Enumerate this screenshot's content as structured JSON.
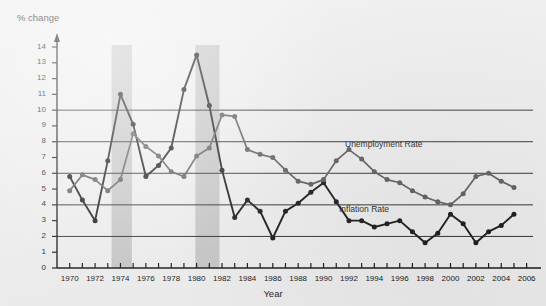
{
  "chart_data": {
    "type": "line",
    "title": "",
    "ylabel": "% change",
    "xlabel": "Year",
    "xlim": [
      1969,
      2006.5
    ],
    "ylim": [
      0,
      14.6
    ],
    "grid": "horizontal gridlines at 2, 4, 6, 8, 10",
    "legend_position": "inline annotations near series",
    "y_ticks": [
      0,
      1,
      2,
      3,
      4,
      5,
      6,
      7,
      8,
      9,
      10,
      11,
      12,
      13,
      14
    ],
    "gridline_values": [
      2,
      4,
      6,
      8,
      10
    ],
    "x_ticks": [
      1970,
      1971,
      1972,
      1973,
      1974,
      1975,
      1976,
      1977,
      1978,
      1979,
      1980,
      1981,
      1982,
      1983,
      1984,
      1985,
      1986,
      1987,
      1988,
      1989,
      1990,
      1991,
      1992,
      1993,
      1994,
      1995,
      1996,
      1997,
      1998,
      1999,
      2000,
      2001,
      2002,
      2003,
      2004,
      2005,
      2006
    ],
    "x_tick_labels": [
      "1970",
      "1972",
      "1974",
      "1976",
      "1978",
      "1980",
      "1982",
      "1984",
      "1986",
      "1988",
      "1990",
      "1992",
      "1994",
      "1996",
      "1998",
      "2000",
      "2002",
      "2004",
      "2006"
    ],
    "x_tick_label_values": [
      1970,
      1972,
      1974,
      1976,
      1978,
      1980,
      1982,
      1984,
      1986,
      1988,
      1990,
      1992,
      1994,
      1996,
      1998,
      2000,
      2002,
      2004,
      2006
    ],
    "x": [
      1970,
      1971,
      1972,
      1973,
      1974,
      1975,
      1976,
      1977,
      1978,
      1979,
      1980,
      1981,
      1982,
      1983,
      1984,
      1985,
      1986,
      1987,
      1988,
      1989,
      1990,
      1991,
      1992,
      1993,
      1994,
      1995,
      1996,
      1997,
      1998,
      1999,
      2000,
      2001,
      2002,
      2003,
      2004,
      2005
    ],
    "series": [
      {
        "name": "Inflation Rate",
        "color": "#141414",
        "values": [
          5.8,
          4.3,
          3.0,
          6.8,
          11.0,
          9.1,
          5.8,
          6.5,
          7.6,
          11.3,
          13.5,
          10.3,
          6.2,
          3.2,
          4.3,
          3.6,
          1.9,
          3.6,
          4.1,
          4.8,
          5.4,
          4.2,
          3.0,
          3.0,
          2.6,
          2.8,
          3.0,
          2.3,
          1.6,
          2.2,
          3.4,
          2.8,
          1.6,
          2.3,
          2.7,
          3.4
        ]
      },
      {
        "name": "Unemployment Rate",
        "color": "#595959",
        "values": [
          4.9,
          5.9,
          5.6,
          4.9,
          5.6,
          8.5,
          7.7,
          7.1,
          6.1,
          5.8,
          7.1,
          7.6,
          9.7,
          9.6,
          7.5,
          7.2,
          7.0,
          6.2,
          5.5,
          5.3,
          5.6,
          6.8,
          7.5,
          6.9,
          6.1,
          5.6,
          5.4,
          4.9,
          4.5,
          4.2,
          4.0,
          4.7,
          5.8,
          6.0,
          5.5,
          5.1
        ]
      }
    ],
    "shaded_bands": [
      {
        "name": "recession-band-1973-1975",
        "start": 1973.3,
        "end": 1974.9,
        "color": "#bfbfbf"
      },
      {
        "name": "recession-band-1980-1982",
        "start": 1979.9,
        "end": 1981.8,
        "color": "#bfbfbf"
      }
    ],
    "annotations": [
      {
        "name": "unemployment-label",
        "text": "Unemployment Rate"
      },
      {
        "name": "inflation-label",
        "text": "Inflation Rate"
      }
    ]
  }
}
